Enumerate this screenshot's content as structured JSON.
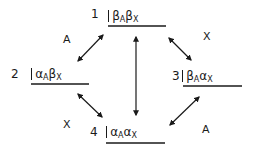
{
  "diagram": {
    "type": "energy-level-transition-diagram",
    "levels": [
      {
        "number": "1",
        "state": {
          "a": "β",
          "a_sub": "A",
          "b": "β",
          "b_sub": "X"
        }
      },
      {
        "number": "2",
        "state": {
          "a": "α",
          "a_sub": "A",
          "b": "β",
          "b_sub": "X"
        }
      },
      {
        "number": "3",
        "state": {
          "a": "β",
          "a_sub": "A",
          "b": "α",
          "b_sub": "X"
        }
      },
      {
        "number": "4",
        "state": {
          "a": "α",
          "a_sub": "A",
          "b": "α",
          "b_sub": "X"
        }
      }
    ],
    "transitions": [
      {
        "from": "1",
        "to": "2",
        "label": "A"
      },
      {
        "from": "1",
        "to": "3",
        "label": "X"
      },
      {
        "from": "2",
        "to": "4",
        "label": "X"
      },
      {
        "from": "3",
        "to": "4",
        "label": "A"
      },
      {
        "from": "1",
        "to": "4",
        "label": ""
      }
    ],
    "line_color": "#1a1a1a"
  }
}
